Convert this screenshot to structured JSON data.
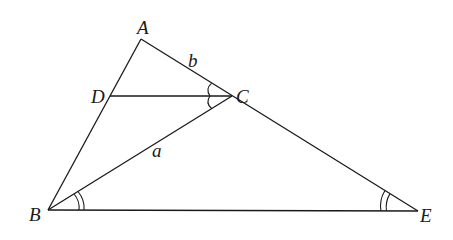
{
  "diagram": {
    "type": "geometry-triangle",
    "points": {
      "A": {
        "label": "A",
        "x": 141,
        "y": 39
      },
      "D": {
        "label": "D",
        "x": 110,
        "y": 96
      },
      "C": {
        "label": "C",
        "x": 232,
        "y": 96
      },
      "B": {
        "label": "B",
        "x": 48,
        "y": 210
      },
      "E": {
        "label": "E",
        "x": 418,
        "y": 211
      }
    },
    "segments": [
      {
        "from": "A",
        "to": "B"
      },
      {
        "from": "A",
        "to": "E"
      },
      {
        "from": "B",
        "to": "E"
      },
      {
        "from": "D",
        "to": "C"
      },
      {
        "from": "B",
        "to": "C"
      }
    ],
    "segment_labels": {
      "b": {
        "text": "b",
        "on": "AC"
      },
      "a": {
        "text": "a",
        "on": "BC"
      }
    },
    "angle_marks": [
      {
        "vertex": "C",
        "between": [
          "A",
          "D"
        ],
        "arcs": 1
      },
      {
        "vertex": "C",
        "between": [
          "D",
          "B"
        ],
        "arcs": 1
      },
      {
        "vertex": "B",
        "between": [
          "C",
          "E"
        ],
        "arcs": 2
      },
      {
        "vertex": "E",
        "between": [
          "B",
          "A"
        ],
        "arcs": 2
      }
    ],
    "line_color": "#1a1a1a",
    "background": "#ffffff"
  }
}
